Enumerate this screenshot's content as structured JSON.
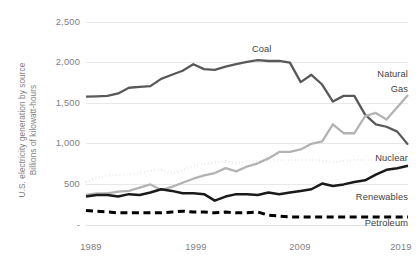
{
  "chart_data": {
    "type": "line",
    "title": "",
    "subtitle": "",
    "xlabel": "",
    "ylabel": "U.S. electricity generation by source",
    "ylabel_line2": "Billions of kilowatt-hours",
    "ylabel_full": "U.S. electricity generation by source Billions of kilowatt-hours",
    "grid": true,
    "legend_position": "inline-labels",
    "xlim": [
      1989,
      2019
    ],
    "ylim": [
      0,
      2500
    ],
    "ytick_values": [
      0,
      500,
      1000,
      1500,
      2000,
      2500
    ],
    "ytick_labels": [
      "-",
      "500",
      "1,000",
      "1,500",
      "2,000",
      "2,500"
    ],
    "xtick_values": [
      1989,
      1999,
      2009,
      2019
    ],
    "xtick_labels": [
      "1989",
      "1999",
      "2009",
      "2019"
    ],
    "x": [
      1989,
      1990,
      1991,
      1992,
      1993,
      1994,
      1995,
      1996,
      1997,
      1998,
      1999,
      2000,
      2001,
      2002,
      2003,
      2004,
      2005,
      2006,
      2007,
      2008,
      2009,
      2010,
      2011,
      2012,
      2013,
      2014,
      2015,
      2016,
      2017,
      2018,
      2019
    ],
    "series": [
      {
        "name": "Coal",
        "label": "Coal",
        "color": "#595959",
        "style": "solid",
        "width": 2.3,
        "values": [
          1580,
          1585,
          1590,
          1620,
          1690,
          1700,
          1710,
          1800,
          1850,
          1900,
          1980,
          1920,
          1910,
          1950,
          1980,
          2010,
          2030,
          2020,
          2020,
          2000,
          1760,
          1850,
          1730,
          1520,
          1590,
          1590,
          1360,
          1240,
          1210,
          1150,
          990
        ]
      },
      {
        "name": "Natural Gas",
        "label_line1": "Natural",
        "label_line2": "Gas",
        "color": "#b3b3b3",
        "style": "solid",
        "width": 2.3,
        "values": [
          370,
          390,
          390,
          410,
          420,
          460,
          500,
          430,
          470,
          520,
          570,
          610,
          640,
          700,
          660,
          720,
          760,
          820,
          900,
          900,
          930,
          1000,
          1030,
          1240,
          1130,
          1130,
          1340,
          1380,
          1300,
          1450,
          1600
        ]
      },
      {
        "name": "Nuclear",
        "label": "Nuclear",
        "color": "#4d4d4d",
        "style": "dotted",
        "width": 2.3,
        "values": [
          530,
          580,
          610,
          620,
          620,
          640,
          670,
          680,
          630,
          680,
          730,
          750,
          770,
          780,
          760,
          790,
          780,
          790,
          800,
          800,
          800,
          800,
          790,
          770,
          790,
          800,
          800,
          800,
          800,
          805,
          810
        ]
      },
      {
        "name": "Renewables",
        "label": "Renewables",
        "color": "#1a1a1a",
        "style": "solid",
        "width": 2.5,
        "values": [
          350,
          370,
          370,
          350,
          380,
          370,
          400,
          440,
          420,
          390,
          390,
          380,
          300,
          350,
          380,
          380,
          370,
          400,
          380,
          400,
          420,
          440,
          510,
          480,
          500,
          530,
          550,
          620,
          680,
          700,
          730
        ]
      },
      {
        "name": "Petroleum",
        "label": "Petroleum",
        "color": "#000000",
        "style": "dashed",
        "width": 3.0,
        "values": [
          180,
          170,
          160,
          150,
          150,
          150,
          150,
          150,
          160,
          170,
          160,
          160,
          150,
          160,
          150,
          150,
          160,
          120,
          110,
          100,
          100,
          100,
          100,
          100,
          100,
          100,
          100,
          100,
          100,
          100,
          100
        ]
      }
    ]
  },
  "labels": {
    "coal": "Coal",
    "natural_gas_line1": "Natural",
    "natural_gas_line2": "Gas",
    "nuclear": "Nuclear",
    "renewables": "Renewables",
    "petroleum": "Petroleum"
  },
  "axis": {
    "y_title_line1": "U.S. electricity generation by source",
    "y_title_line2": "Billions of kilowatt-hours",
    "y_ticks": [
      "2,500",
      "2,000",
      "1,500",
      "1,000",
      "500",
      "-"
    ],
    "x_ticks": [
      "1989",
      "1999",
      "2009",
      "2019"
    ]
  },
  "colors": {
    "coal": "#595959",
    "natural_gas": "#b3b3b3",
    "nuclear": "#4d4d4d",
    "renewables": "#1a1a1a",
    "petroleum": "#000000",
    "gridline": "#e8e8e8",
    "text": "#808080",
    "background": "#ffffff"
  }
}
